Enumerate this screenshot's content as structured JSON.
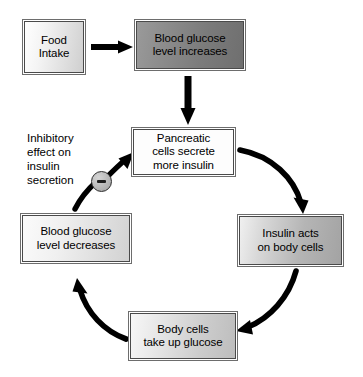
{
  "diagram": {
    "nodes": [
      {
        "id": "food-intake",
        "label": "Food\nIntake"
      },
      {
        "id": "glucose-increase",
        "label": "Blood glucose\nlevel increases"
      },
      {
        "id": "pancreatic",
        "label": "Pancreatic\ncells secrete\nmore insulin"
      },
      {
        "id": "insulin-acts",
        "label": "Insulin acts\non body cells"
      },
      {
        "id": "body-cells",
        "label": "Body cells\ntake up glucose"
      },
      {
        "id": "glucose-decrease",
        "label": "Blood glucose\nlevel decreases"
      }
    ],
    "annotation": {
      "inhibitory_label": "Inhibitory\neffect on\ninsulin\nsecretion",
      "inhibitory_symbol": "minus-circle-icon"
    },
    "colors": {
      "stroke": "#000000",
      "box_border": "#4a4a4a",
      "box_outer_border": "#6d6d6d",
      "text": "#000000",
      "background": "#ffffff",
      "highlight_box_fill": "#7b7b7b",
      "badge_fill": "#b8b8b8"
    },
    "edges": [
      {
        "id": "food-to-increase",
        "from": "food-intake",
        "to": "glucose-increase",
        "shape": "straight-horizontal"
      },
      {
        "id": "increase-to-pancreatic",
        "from": "glucose-increase",
        "to": "pancreatic",
        "shape": "straight-vertical"
      },
      {
        "id": "pancreatic-to-insulin",
        "from": "pancreatic",
        "to": "insulin-acts",
        "shape": "curve-clockwise"
      },
      {
        "id": "insulin-to-bodycells",
        "from": "insulin-acts",
        "to": "body-cells",
        "shape": "curve-clockwise"
      },
      {
        "id": "bodycells-to-decrease",
        "from": "body-cells",
        "to": "glucose-decrease",
        "shape": "curve-clockwise"
      },
      {
        "id": "decrease-to-pancreatic",
        "from": "glucose-decrease",
        "to": "pancreatic",
        "shape": "curve-inhibitory"
      }
    ]
  }
}
